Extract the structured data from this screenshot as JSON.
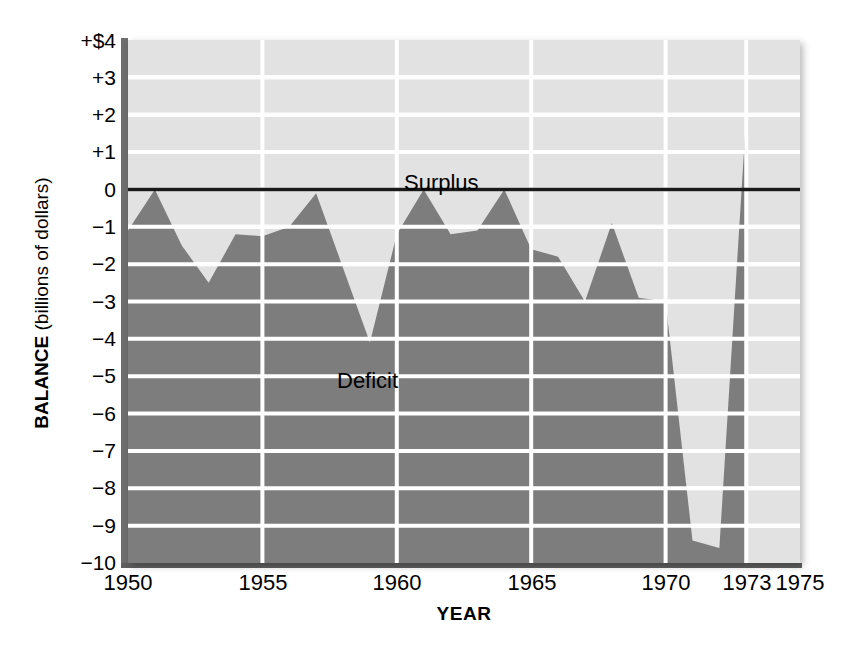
{
  "chart_data": {
    "type": "area",
    "title": "",
    "subtitle": "",
    "xlabel": "YEAR",
    "ylabel": "BALANCE (billions of dollars)",
    "ylabel_bold_part": "BALANCE",
    "ylabel_rest": " (billions of dollars)",
    "xlim": [
      1950,
      1975
    ],
    "ylim": [
      -10,
      4
    ],
    "grid": true,
    "legend_position": "none",
    "x": [
      1950,
      1951,
      1952,
      1953,
      1954,
      1955,
      1956,
      1957,
      1958,
      1959,
      1960,
      1961,
      1962,
      1963,
      1964,
      1965,
      1966,
      1967,
      1968,
      1969,
      1970,
      1971,
      1972,
      1973
    ],
    "values": [
      -1.1,
      0.0,
      -1.5,
      -2.5,
      -1.2,
      -1.25,
      -1.0,
      -0.1,
      -2.1,
      -4.1,
      -1.2,
      0.0,
      -1.2,
      -1.1,
      0.0,
      -1.6,
      -1.8,
      -3.0,
      -0.9,
      -2.9,
      -3.0,
      -9.4,
      -9.6,
      2.0
    ],
    "series": [
      {
        "name": "Balance",
        "values": [
          -1.1,
          0.0,
          -1.5,
          -2.5,
          -1.2,
          -1.25,
          -1.0,
          -0.1,
          -2.1,
          -4.1,
          -1.2,
          0.0,
          -1.2,
          -1.1,
          0.0,
          -1.6,
          -1.8,
          -3.0,
          -0.9,
          -2.9,
          -3.0,
          -9.4,
          -9.6,
          2.0
        ]
      }
    ],
    "yticks": [
      4,
      3,
      2,
      1,
      0,
      -1,
      -2,
      -3,
      -4,
      -5,
      -6,
      -7,
      -8,
      -9,
      -10
    ],
    "ytick_labels": [
      "+$4",
      "+3",
      "+2",
      "+1",
      "0",
      "−1",
      "−2",
      "−3",
      "−4",
      "−5",
      "−6",
      "−7",
      "−8",
      "−9",
      "−10"
    ],
    "xticks": [
      1950,
      1955,
      1960,
      1965,
      1970,
      1973,
      1975
    ],
    "xtick_labels": [
      "1950",
      "1955",
      "1960",
      "1965",
      "1970",
      "1973",
      "1975"
    ],
    "gridline_years": [
      1955,
      1960,
      1965,
      1970,
      1973
    ],
    "annotations": [
      {
        "text": "Surplus",
        "x": 1960.3,
        "y": 0.55
      },
      {
        "text": "Deficit",
        "x": 1957.8,
        "y": -4.85
      }
    ],
    "colors": {
      "plot_background": "#e2e2e2",
      "area_fill": "#7d7d7d",
      "gridline": "#ffffff",
      "zero_line": "#1a1a1a",
      "axis_spine": "#6e6e6e",
      "text": "#000000"
    }
  }
}
